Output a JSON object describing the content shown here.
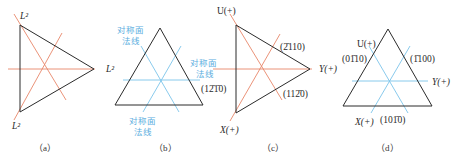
{
  "colors": {
    "triangle": "#2b2b2b",
    "red_axis": "#e8876a",
    "blue_axis": "#7cc4ea",
    "blue_text": "#5aaee0"
  },
  "panels": [
    {
      "id": "a",
      "caption": "（a）",
      "labels": {
        "top": "L²",
        "right": "L²",
        "bottom": "L²"
      }
    },
    {
      "id": "b",
      "caption": "（b）",
      "labels": {
        "top_left_1": "对称面",
        "top_left_2": "法线",
        "right_1": "对称面",
        "right_2": "法线",
        "bottom_1": "对称面",
        "bottom_2": "法线"
      }
    },
    {
      "id": "c",
      "caption": "（c）",
      "labels": {
        "U": "U(+)",
        "Y": "Y(+)",
        "X": "X(+)",
        "upper_right_plane": "(2̄110)",
        "lower_right_plane": "(112̄0)",
        "left_plane": "(12̄1̄0)"
      }
    },
    {
      "id": "d",
      "caption": "（d）",
      "labels": {
        "U": "U(+)",
        "Y": "Y(+)",
        "X": "X(+)",
        "upper_left_plane": "(01̄10)",
        "upper_right_plane": "(1̄100)",
        "bottom_plane": "(101̄0)"
      }
    }
  ]
}
